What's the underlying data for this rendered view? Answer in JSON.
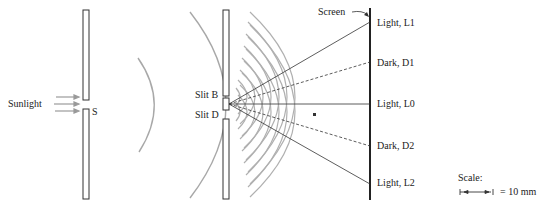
{
  "diagram": {
    "source_label": "Sunlight",
    "single_slit_label": "S",
    "slit_b_label": "Slit B",
    "slit_d_label": "Slit D",
    "screen_label": "Screen",
    "fringes": [
      {
        "label": "Light, L1",
        "type": "light",
        "y": 22
      },
      {
        "label": "Dark, D1",
        "type": "dark",
        "y": 62
      },
      {
        "label": "Light, L0",
        "type": "light",
        "y": 104
      },
      {
        "label": "Dark, D2",
        "type": "dark",
        "y": 146
      },
      {
        "label": "Light, L2",
        "type": "light",
        "y": 184
      }
    ],
    "scale": {
      "label": "Scale:",
      "value": "= 10 mm"
    },
    "colors": {
      "wave": "#a8a8a8",
      "line": "#333333",
      "screen": "#222222",
      "arrow": "#9a9a9a"
    }
  }
}
